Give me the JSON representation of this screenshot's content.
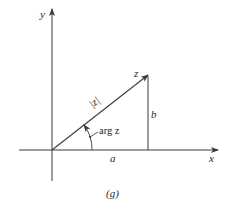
{
  "figure": {
    "caption": "(g)",
    "axes": {
      "x_label": "x",
      "y_label": "y"
    },
    "vector": {
      "tip_label": "z",
      "magnitude_label": "|z|",
      "angle_label": "arg z"
    },
    "components": {
      "horizontal_label": "a",
      "vertical_label": "b"
    },
    "colors": {
      "stroke": "#3a3a3a",
      "text": "#2a2a2a",
      "background": "#ffffff"
    }
  }
}
